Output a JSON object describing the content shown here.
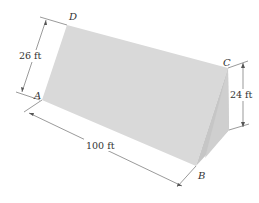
{
  "figure": {
    "vertices": {
      "A": "A",
      "B": "B",
      "C": "C",
      "D": "D"
    },
    "dimensions": {
      "slant_height": "26 ft",
      "vertical_height": "24 ft",
      "length": "100 ft"
    },
    "colors": {
      "front_face": "#d6d6d6",
      "end_face": "#c4c4c4",
      "line": "#555555"
    }
  }
}
